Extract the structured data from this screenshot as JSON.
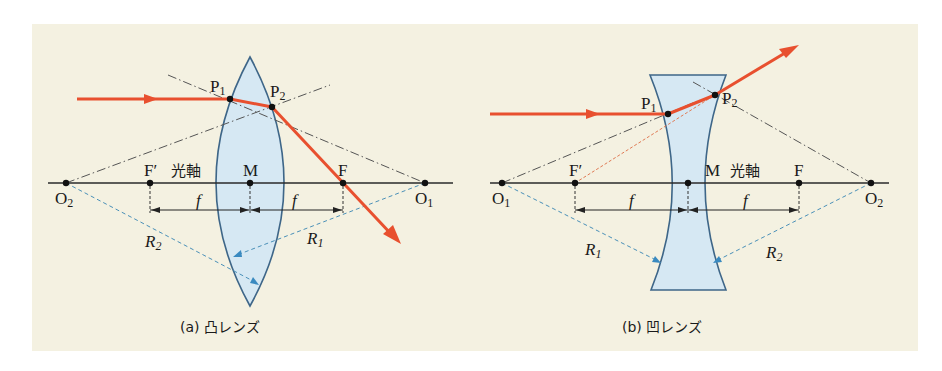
{
  "figure": {
    "background_color": "#f4f1e1",
    "ray_color": "#e8502f",
    "lens_fill_color": "#d6e8f3",
    "lens_stroke_color": "#3e6688",
    "radius_color": "#4a90b8"
  },
  "panels": [
    {
      "id": "a",
      "caption": "(a) 凸レンズ",
      "lens_type": "convex",
      "axis_label": "光軸",
      "labels": {
        "P1": "P",
        "P1_sub": "1",
        "P2": "P",
        "P2_sub": "2",
        "F_prime": "F′",
        "M": "M",
        "F": "F",
        "O_left": "O",
        "O_left_sub": "2",
        "O_right": "O",
        "O_right_sub": "1",
        "f_left": "f",
        "f_right": "f",
        "R_left": "R",
        "R_left_sub": "2",
        "R_right": "R",
        "R_right_sub": "1"
      }
    },
    {
      "id": "b",
      "caption": "(b) 凹レンズ",
      "lens_type": "concave",
      "axis_label": "光軸",
      "labels": {
        "P1": "P",
        "P1_sub": "1",
        "P2": "P",
        "P2_sub": "2",
        "F_prime": "F′",
        "M": "M",
        "F": "F",
        "O_left": "O",
        "O_left_sub": "1",
        "O_right": "O",
        "O_right_sub": "2",
        "f_left": "f",
        "f_right": "f",
        "R_left": "R",
        "R_left_sub": "1",
        "R_right": "R",
        "R_right_sub": "2"
      }
    }
  ]
}
